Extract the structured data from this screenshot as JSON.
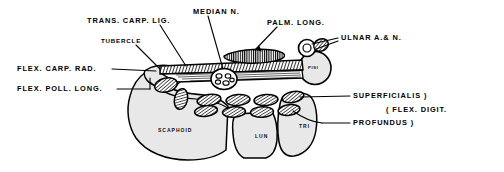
{
  "figure": {
    "background_color": "#ffffff",
    "ink_color": "#000000",
    "bone_fill_color": "#e8e8e8",
    "tendon_fill_color": "#ffffff"
  },
  "labels": [
    {
      "id": "trans-carp-lig",
      "text": "TRANS. CARP. LIG.",
      "x": 87,
      "y": 17,
      "size": "normal"
    },
    {
      "id": "median-n",
      "text": "MEDIAN N.",
      "x": 193,
      "y": 8,
      "size": "normal"
    },
    {
      "id": "palm-long",
      "text": "PALM. LONG.",
      "x": 267,
      "y": 19,
      "size": "normal"
    },
    {
      "id": "ulnar-a-n",
      "text": "ULNAR A.& N.",
      "x": 341,
      "y": 34,
      "size": "normal"
    },
    {
      "id": "tubercle",
      "text": "TUBERCLE",
      "x": 101,
      "y": 38,
      "size": "small"
    },
    {
      "id": "flex-carp-rad",
      "text": "FLEX. CARP. RAD.",
      "x": 17,
      "y": 66,
      "size": "normal"
    },
    {
      "id": "flex-poll-long",
      "text": "FLEX. POLL. LONG.",
      "x": 17,
      "y": 86,
      "size": "normal"
    },
    {
      "id": "superficialis",
      "text": "SUPERFICIALIS )",
      "x": 353,
      "y": 93,
      "size": "normal"
    },
    {
      "id": "flex-digit",
      "text": "( FLEX. DIGIT.",
      "x": 386,
      "y": 107,
      "size": "normal"
    },
    {
      "id": "profundus",
      "text": "PROFUNDUS )",
      "x": 353,
      "y": 120,
      "size": "normal"
    }
  ],
  "bone_labels": [
    {
      "id": "scaphoid",
      "text": "SCAPHOID",
      "x": 158,
      "y": 128,
      "size": "normal"
    },
    {
      "id": "lunate",
      "text": "LUN",
      "x": 258,
      "y": 134,
      "size": "normal"
    },
    {
      "id": "triquetrum",
      "text": "TRI",
      "x": 300,
      "y": 124,
      "size": "normal"
    },
    {
      "id": "pisiform",
      "text": "PISI",
      "x": 314,
      "y": 68,
      "size": "tiny"
    }
  ],
  "structures": {
    "bones": [
      {
        "name": "scaphoid",
        "label": "SCAPHOID"
      },
      {
        "name": "lunate",
        "label": "LUN"
      },
      {
        "name": "triquetrum",
        "label": "TRI"
      },
      {
        "name": "pisiform",
        "label": "PISI"
      }
    ],
    "soft_tissue": [
      {
        "name": "transverse-carpal-ligament",
        "label": "TRANS. CARP. LIG."
      },
      {
        "name": "median-nerve",
        "label": "MEDIAN N."
      },
      {
        "name": "palmaris-longus-tendon",
        "label": "PALM. LONG."
      },
      {
        "name": "ulnar-artery-and-nerve",
        "label": "ULNAR A.& N."
      },
      {
        "name": "flexor-carpi-radialis-tendon",
        "label": "FLEX. CARP. RAD."
      },
      {
        "name": "flexor-pollicis-longus-tendon",
        "label": "FLEX. POLL. LONG."
      },
      {
        "name": "flexor-digitorum-superficialis-tendons",
        "label": "SUPERFICIALIS )"
      },
      {
        "name": "flexor-digitorum-profundus-tendons",
        "label": "PROFUNDUS )"
      },
      {
        "name": "scaphoid-tubercle",
        "label": "TUBERCLE"
      }
    ],
    "tendon_counts": {
      "superficialis_row": 4,
      "profundus_row": 4
    }
  }
}
